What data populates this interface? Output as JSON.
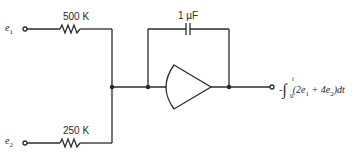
{
  "diagram": {
    "type": "op-amp integrator circuit",
    "inputs": [
      {
        "node": "e",
        "subscript": "1",
        "resistor_label": "500 K"
      },
      {
        "node": "e",
        "subscript": "2",
        "resistor_label": "250 K"
      }
    ],
    "feedback": {
      "component": "capacitor",
      "label": "1 µF"
    },
    "amplifier": {
      "symbol": "op-amp"
    },
    "output": {
      "sign": "-",
      "integral_symbol": "∫",
      "upper_limit": "t",
      "lower_limit": "0",
      "integrand_open": "(2e",
      "sub1": "1",
      "plus": " + 4e",
      "sub2": "2",
      "integrand_close": ")dt"
    },
    "colors": {
      "line": "#2a2a2a",
      "background": "#ffffff"
    }
  }
}
